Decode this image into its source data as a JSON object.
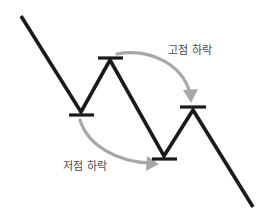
{
  "diagram": {
    "background_color": "#ffffff",
    "price_line": {
      "color": "#1a1a1a",
      "width": 3.6,
      "points": [
        {
          "x": 21,
          "y": 16,
          "role": "start"
        },
        {
          "x": 81,
          "y": 112,
          "role": "trough-1"
        },
        {
          "x": 110,
          "y": 60,
          "role": "peak-1"
        },
        {
          "x": 164,
          "y": 156,
          "role": "trough-2"
        },
        {
          "x": 193,
          "y": 110,
          "role": "peak-2"
        },
        {
          "x": 253,
          "y": 207,
          "role": "end"
        }
      ]
    },
    "level_markers": [
      {
        "name": "trough-1-level",
        "x1": 69,
        "x2": 94,
        "y": 115,
        "color": "#1a1a1a"
      },
      {
        "name": "peak-1-level",
        "x1": 98,
        "x2": 123,
        "y": 58,
        "color": "#1a1a1a"
      },
      {
        "name": "trough-2-level",
        "x1": 152,
        "x2": 177,
        "y": 159,
        "color": "#1a1a1a"
      },
      {
        "name": "peak-2-level",
        "x1": 180,
        "x2": 206,
        "y": 107,
        "color": "#1a1a1a"
      }
    ],
    "annotations": [
      {
        "id": "high-decline",
        "label": "고점 하락",
        "text_color": "#4a4a4a",
        "arrow_color": "#a8a8a8",
        "arrow_direction": "down",
        "from": {
          "x": 118,
          "y": 55
        },
        "to": {
          "x": 191,
          "y": 102
        }
      },
      {
        "id": "low-decline",
        "label": "저점 하락",
        "text_color": "#4a4a4a",
        "arrow_color": "#a8a8a8",
        "arrow_direction": "right",
        "from": {
          "x": 80,
          "y": 121
        },
        "to": {
          "x": 158,
          "y": 164
        }
      }
    ]
  }
}
